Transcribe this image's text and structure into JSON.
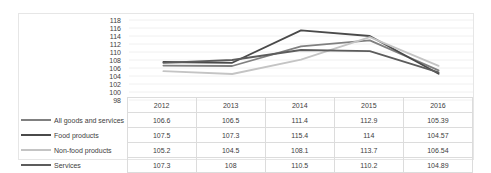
{
  "chart_data": {
    "type": "line",
    "title": "",
    "xlabel": "",
    "ylabel": "",
    "categories": [
      "2012",
      "2013",
      "2014",
      "2015",
      "2016"
    ],
    "ylim": [
      98,
      118
    ],
    "ytick_step": 2,
    "yticks": [
      118,
      116,
      114,
      112,
      110,
      108,
      106,
      104,
      102,
      100,
      98
    ],
    "grid": true,
    "legend_position": "table-left",
    "series": [
      {
        "name": "All goods and services",
        "color": "#808080",
        "width": 1.8,
        "values": [
          106.6,
          106.5,
          111.4,
          112.9,
          105.39
        ],
        "display_values": [
          "106.6",
          "106.5",
          "111.4",
          "112.9",
          "105.39"
        ]
      },
      {
        "name": "Food products",
        "color": "#4a4a4a",
        "width": 1.8,
        "values": [
          107.5,
          107.3,
          115.4,
          114,
          104.57
        ],
        "display_values": [
          "107.5",
          "107.3",
          "115.4",
          "114",
          "104.57"
        ]
      },
      {
        "name": "Non-food products",
        "color": "#c4c4c4",
        "width": 1.8,
        "values": [
          105.2,
          104.5,
          108.1,
          113.7,
          106.54
        ],
        "display_values": [
          "105.2",
          "104.5",
          "108.1",
          "113.7",
          "106.54"
        ]
      },
      {
        "name": "Services",
        "color": "#5c5c5c",
        "width": 1.8,
        "values": [
          107.3,
          108,
          110.5,
          110.2,
          104.89
        ],
        "display_values": [
          "107.3",
          "108",
          "110.5",
          "110.2",
          "104.89"
        ]
      }
    ]
  },
  "table": {
    "corner_label": "",
    "year_headers": [
      "2012",
      "2013",
      "2014",
      "2015",
      "2016"
    ],
    "rows": [
      {
        "label": "All goods and services",
        "cells": [
          "106.6",
          "106.5",
          "111.4",
          "112.9",
          "105.39"
        ]
      },
      {
        "label": "Food products",
        "cells": [
          "107.5",
          "107.3",
          "115.4",
          "114",
          "104.57"
        ]
      },
      {
        "label": "Non-food products",
        "cells": [
          "105.2",
          "104.5",
          "108.1",
          "113.7",
          "106.54"
        ]
      },
      {
        "label": "Services",
        "cells": [
          "107.3",
          "108",
          "110.5",
          "110.2",
          "104.89"
        ]
      }
    ]
  },
  "colors": {
    "frame_border": "#e6e6e6",
    "grid": "#f0f0f0",
    "table_border": "#dcdcdc",
    "text": "#3d3d3d"
  }
}
